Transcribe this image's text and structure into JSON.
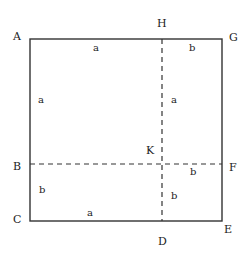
{
  "diagram": {
    "type": "geometric-square-partition",
    "colors": {
      "line": "#333333",
      "text": "#222222",
      "background": "#ffffff"
    },
    "square": {
      "x1": 30,
      "y1": 39,
      "x2": 222,
      "y2": 221
    },
    "dashed_lines": [
      {
        "name": "H-D",
        "x1": 162,
        "y1": 39,
        "x2": 162,
        "y2": 221
      },
      {
        "name": "B-F",
        "x1": 30,
        "y1": 164,
        "x2": 222,
        "y2": 164
      }
    ],
    "points": [
      {
        "id": "A",
        "label": "A",
        "x": 13,
        "y": 40
      },
      {
        "id": "H",
        "label": "H",
        "x": 157,
        "y": 27
      },
      {
        "id": "G",
        "label": "G",
        "x": 229,
        "y": 41
      },
      {
        "id": "B",
        "label": "B",
        "x": 13,
        "y": 170
      },
      {
        "id": "F",
        "label": "F",
        "x": 229,
        "y": 171
      },
      {
        "id": "C",
        "label": "C",
        "x": 13,
        "y": 223
      },
      {
        "id": "E",
        "label": "E",
        "x": 224,
        "y": 233
      },
      {
        "id": "D",
        "label": "D",
        "x": 158,
        "y": 245
      },
      {
        "id": "K",
        "label": "K",
        "x": 146,
        "y": 154
      }
    ],
    "segment_labels": [
      {
        "id": "AH",
        "label": "a",
        "x": 93,
        "y": 51
      },
      {
        "id": "HG",
        "label": "b",
        "x": 189,
        "y": 51
      },
      {
        "id": "AB",
        "label": "a",
        "x": 38,
        "y": 103
      },
      {
        "id": "HK",
        "label": "a",
        "x": 171,
        "y": 103
      },
      {
        "id": "KF",
        "label": "b",
        "x": 190,
        "y": 175
      },
      {
        "id": "BC",
        "label": "b",
        "x": 39,
        "y": 193
      },
      {
        "id": "KD",
        "label": "b",
        "x": 171,
        "y": 199
      },
      {
        "id": "CD",
        "label": "a",
        "x": 87,
        "y": 216
      }
    ]
  }
}
